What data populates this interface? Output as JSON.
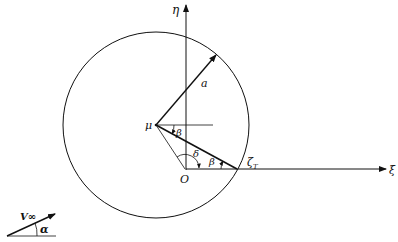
{
  "diagram": {
    "type": "geometric-construction",
    "labels": {
      "eta_axis": "η",
      "xi_axis": "ξ",
      "radius": "a",
      "center": "μ",
      "origin": "O",
      "trailing_point": "ζ",
      "trailing_sub": "T",
      "angle_beta_top": "β",
      "angle_beta_bottom": "β",
      "angle_delta": "δ",
      "freestream": "V∞",
      "angle_alpha": "α"
    },
    "geometry": {
      "circle_center": [
        156,
        125
      ],
      "circle_radius": 93,
      "origin": [
        185,
        169
      ],
      "trailing_point": [
        237,
        169
      ],
      "radius_tip": [
        216,
        55
      ]
    },
    "colors": {
      "stroke": "#111111",
      "background": "#ffffff"
    }
  }
}
